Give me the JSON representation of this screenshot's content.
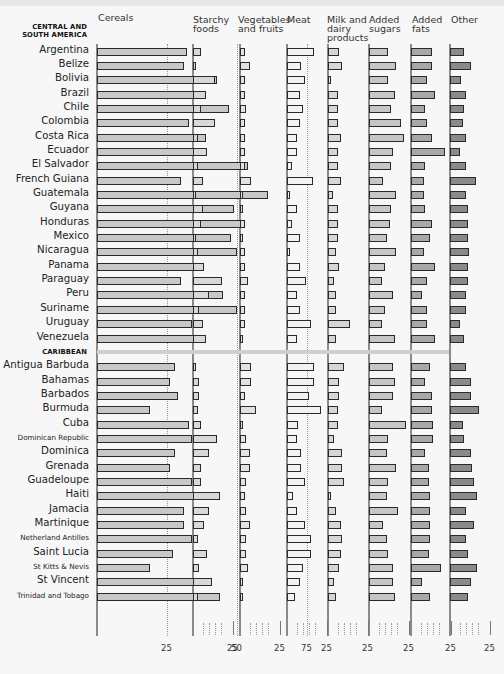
{
  "chart_data": {
    "type": "bar",
    "orientation": "horizontal",
    "layout": "small-multiples",
    "title": "",
    "xlabel": "",
    "columns": [
      {
        "key": "cereals",
        "label": "Cereals",
        "ticks": [
          "25",
          "50",
          "75"
        ],
        "fill": "#c8c8c8"
      },
      {
        "key": "starchy",
        "label": "Starchy foods",
        "ticks": [
          "25"
        ],
        "fill": "#d8d8d8"
      },
      {
        "key": "veg",
        "label": "Vegetables and fruits",
        "ticks": [
          "25"
        ],
        "fill": "#e2e2e2"
      },
      {
        "key": "meat",
        "label": "Meat",
        "ticks": [
          "25"
        ],
        "fill": "#f2f2f2"
      },
      {
        "key": "milk",
        "label": "Milk and dairy products",
        "ticks": [
          "25"
        ],
        "fill": "#d6d6d6"
      },
      {
        "key": "sugars",
        "label": "Added sugars",
        "ticks": [
          "25"
        ],
        "fill": "#c6c6c6"
      },
      {
        "key": "fats",
        "label": "Added fats",
        "ticks": [
          "25"
        ],
        "fill": "#a8a8a8"
      },
      {
        "key": "other",
        "label": "Other",
        "ticks": [
          "25"
        ],
        "fill": "#8a8a8a"
      }
    ],
    "groups": [
      {
        "name": "CENTRAL AND SOUTH AMERICA",
        "rows": [
          {
            "country": "Argentina",
            "values": [
              32,
              5,
              3,
              17,
              7,
              12,
              13,
              9
            ]
          },
          {
            "country": "Belize",
            "values": [
              31,
              2,
              6,
              9,
              9,
              17,
              13,
              13
            ]
          },
          {
            "country": "Bolivia",
            "values": [
              43,
              14,
              3,
              11,
              2,
              12,
              10,
              7
            ]
          },
          {
            "country": "Brazil",
            "values": [
              36,
              8,
              3,
              8,
              6,
              16,
              15,
              10
            ]
          },
          {
            "country": "Chile",
            "values": [
              47,
              5,
              4,
              10,
              6,
              14,
              9,
              9
            ]
          },
          {
            "country": "Colombia",
            "values": [
              33,
              14,
              3,
              8,
              6,
              20,
              10,
              8
            ]
          },
          {
            "country": "Costa Rica",
            "values": [
              39,
              3,
              3,
              6,
              8,
              22,
              13,
              10
            ]
          },
          {
            "country": "Ecuador",
            "values": [
              36,
              9,
              3,
              6,
              6,
              15,
              21,
              6
            ]
          },
          {
            "country": "El Salvador",
            "values": [
              54,
              3,
              3,
              3,
              6,
              14,
              9,
              10
            ]
          },
          {
            "country": "French Guiana",
            "values": [
              30,
              6,
              7,
              16,
              8,
              9,
              8,
              16
            ]
          },
          {
            "country": "Guatemala",
            "values": [
              61,
              2,
              2,
              2,
              3,
              17,
              8,
              10
            ]
          },
          {
            "country": "Guyana",
            "values": [
              49,
              6,
              2,
              6,
              6,
              14,
              9,
              11
            ]
          },
          {
            "country": "Honduras",
            "values": [
              52,
              5,
              3,
              3,
              6,
              13,
              13,
              11
            ]
          },
          {
            "country": "Mexico",
            "values": [
              48,
              2,
              2,
              8,
              6,
              11,
              12,
              11
            ]
          },
          {
            "country": "Nicaragua",
            "values": [
              50,
              3,
              3,
              2,
              5,
              17,
              8,
              12
            ]
          },
          {
            "country": "Panama",
            "values": [
              38,
              7,
              3,
              8,
              7,
              10,
              15,
              11
            ]
          },
          {
            "country": "Paraguay",
            "values": [
              30,
              18,
              5,
              12,
              4,
              8,
              10,
              11
            ]
          },
          {
            "country": "Peru",
            "values": [
              45,
              10,
              3,
              6,
              5,
              15,
              7,
              10
            ]
          },
          {
            "country": "Suriname",
            "values": [
              50,
              4,
              3,
              8,
              5,
              10,
              10,
              10
            ]
          },
          {
            "country": "Uruguay",
            "values": [
              34,
              6,
              3,
              15,
              14,
              8,
              10,
              6
            ]
          },
          {
            "country": "Venezuela",
            "values": [
              38,
              8,
              2,
              6,
              5,
              16,
              15,
              9
            ]
          }
        ]
      },
      {
        "name": "CARIBBEAN",
        "rows": [
          {
            "country": "Antigua Barbuda",
            "values": [
              28,
              2,
              7,
              17,
              10,
              15,
              12,
              10
            ]
          },
          {
            "country": "Bahamas",
            "values": [
              26,
              4,
              7,
              17,
              7,
              16,
              9,
              13
            ]
          },
          {
            "country": "Barbados",
            "values": [
              29,
              4,
              3,
              14,
              7,
              15,
              13,
              13
            ]
          },
          {
            "country": "Burmuda",
            "values": [
              19,
              3,
              10,
              21,
              6,
              8,
              13,
              18
            ]
          },
          {
            "country": "Cuba",
            "values": [
              33,
              5,
              2,
              7,
              6,
              23,
              14,
              8
            ]
          },
          {
            "country": "Dominican Republic",
            "values": [
              34,
              15,
              4,
              6,
              4,
              12,
              14,
              9
            ]
          },
          {
            "country": "Dominica",
            "values": [
              28,
              10,
              6,
              9,
              9,
              11,
              9,
              13
            ]
          },
          {
            "country": "Grenada",
            "values": [
              26,
              5,
              6,
              9,
              9,
              17,
              11,
              14
            ]
          },
          {
            "country": "Guadeloupe",
            "values": [
              34,
              5,
              4,
              11,
              10,
              12,
              11,
              15
            ]
          },
          {
            "country": "Haiti",
            "values": [
              36,
              17,
              3,
              4,
              2,
              11,
              12,
              17
            ]
          },
          {
            "country": "Jamacia",
            "values": [
              31,
              10,
              4,
              6,
              5,
              18,
              12,
              10
            ]
          },
          {
            "country": "Martinique",
            "values": [
              31,
              7,
              6,
              11,
              8,
              9,
              12,
              15
            ]
          },
          {
            "country": "Netherland Antilles",
            "values": [
              34,
              3,
              4,
              15,
              9,
              11,
              12,
              10
            ]
          },
          {
            "country": "Saint Lucia",
            "values": [
              27,
              9,
              4,
              15,
              8,
              12,
              11,
              11
            ]
          },
          {
            "country": "St Kitts & Nevis",
            "values": [
              19,
              4,
              5,
              10,
              7,
              15,
              19,
              17
            ]
          },
          {
            "country": "St Vincent",
            "values": [
              35,
              12,
              2,
              8,
              4,
              15,
              7,
              13
            ]
          },
          {
            "country": "Trinidad and Tobago",
            "values": [
              44,
              3,
              2,
              5,
              5,
              16,
              12,
              11
            ]
          }
        ]
      }
    ],
    "grid": "dotted vertical at ticks",
    "legend": "none (column headers)",
    "units": "percent of diet"
  }
}
